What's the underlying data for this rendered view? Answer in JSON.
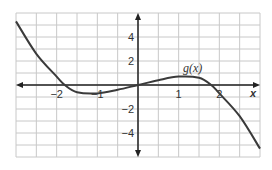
{
  "chart_data": {
    "type": "line",
    "title": "",
    "xlabel": "x",
    "ylabel": "",
    "function_label": "g(x)",
    "xlim": [
      -3,
      3
    ],
    "ylim": [
      -6,
      6
    ],
    "grid": true,
    "grid_spacing": {
      "x": 0.5,
      "y": 1
    },
    "x_ticks": [
      {
        "value": -2,
        "label": "−2"
      },
      {
        "value": -1,
        "label": "−1"
      },
      {
        "value": 1,
        "label": "1"
      },
      {
        "value": 2,
        "label": "2"
      }
    ],
    "y_ticks": [
      {
        "value": 4,
        "label": "4"
      },
      {
        "value": 2,
        "label": "2"
      },
      {
        "value": -2,
        "label": "−2"
      },
      {
        "value": -4,
        "label": "−4"
      }
    ],
    "series": [
      {
        "name": "g(x)",
        "x": [
          -3,
          -2.5,
          -2,
          -1.8,
          -1.5,
          -1,
          -0.5,
          0,
          0.5,
          1,
          1.5,
          1.8,
          2,
          2.5,
          3
        ],
        "y": [
          5.3,
          2.6,
          0.7,
          0,
          -0.6,
          -0.7,
          -0.4,
          0,
          0.4,
          0.7,
          0.6,
          0,
          -0.7,
          -2.6,
          -5.3
        ]
      }
    ],
    "colors": {
      "curve": "#3a3a3a",
      "grid": "#c8c8c8",
      "axis": "#222222"
    }
  }
}
